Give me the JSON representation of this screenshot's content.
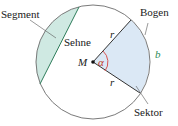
{
  "diagram": {
    "labels": {
      "segment": "Segment",
      "chord": "Sehne",
      "arc": "Bogen",
      "sector": "Sektor",
      "center": "M",
      "radius_top": "r",
      "radius_bottom": "r",
      "angle": "α",
      "arc_length": "b"
    },
    "colors": {
      "circle_stroke": "#7a7a7a",
      "segment_fill": "#cfe9e2",
      "sector_fill": "#dbe8f5",
      "angle_arc": "#d9534f",
      "angle_label": "#c0392b",
      "arc_label": "#2e8b57",
      "text": "#1a1a1a"
    },
    "geometry": {
      "center": [
        93,
        62
      ],
      "radius": 57
    }
  }
}
